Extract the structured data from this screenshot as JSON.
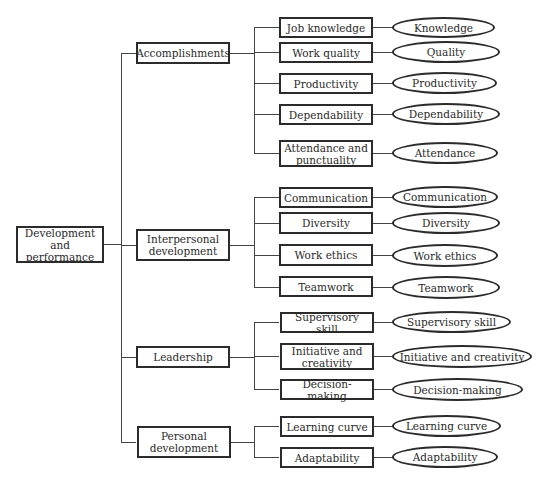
{
  "diagram": {
    "root": {
      "label": "Development and\nperformance"
    },
    "categories": [
      {
        "label": "Accomplishments",
        "criteria": [
          {
            "label": "Job knowledge",
            "measure": "Knowledge"
          },
          {
            "label": "Work quality",
            "measure": "Quality"
          },
          {
            "label": "Productivity",
            "measure": "Productivity"
          },
          {
            "label": "Dependability",
            "measure": "Dependability"
          },
          {
            "label": "Attendance and punctuality",
            "measure": "Attendance"
          }
        ]
      },
      {
        "label": "Interpersonal development",
        "criteria": [
          {
            "label": "Communication",
            "measure": "Communication"
          },
          {
            "label": "Diversity",
            "measure": "Diversity"
          },
          {
            "label": "Work ethics",
            "measure": "Work ethics"
          },
          {
            "label": "Teamwork",
            "measure": "Teamwork"
          }
        ]
      },
      {
        "label": "Leadership",
        "criteria": [
          {
            "label": "Supervisory skill",
            "measure": "Supervisory skill"
          },
          {
            "label": "Initiative and creativity",
            "measure": "Initiative and creativity"
          },
          {
            "label": "Decision-making",
            "measure": "Decision-making"
          }
        ]
      },
      {
        "label": "Personal development",
        "criteria": [
          {
            "label": "Learning curve",
            "measure": "Learning curve"
          },
          {
            "label": "Adaptability",
            "measure": "Adaptability"
          }
        ]
      }
    ]
  },
  "colors": {
    "line": "#444444",
    "border": "#2b2b2b",
    "text": "#2a2a2a",
    "background": "#ffffff"
  }
}
